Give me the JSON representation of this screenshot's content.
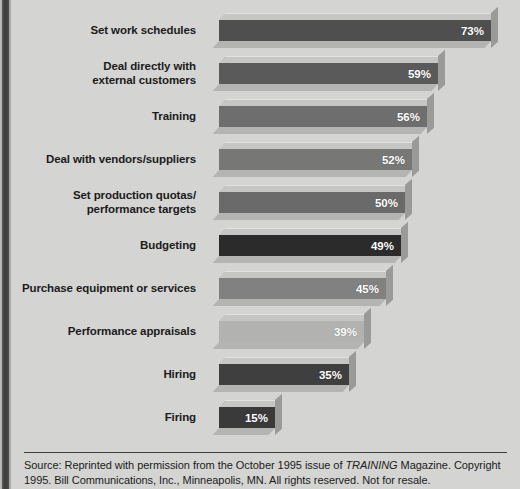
{
  "chart_data": {
    "type": "bar",
    "orientation": "horizontal",
    "title": "",
    "xlabel": "",
    "ylabel": "",
    "xlim": [
      0,
      80
    ],
    "grid": false,
    "legend": null,
    "value_suffix": "%",
    "categories": [
      "Set work schedules",
      "Deal directly with external customers",
      "Training",
      "Deal with vendors/suppliers",
      "Set production quotas/ performance targets",
      "Budgeting",
      "Purchase equipment or services",
      "Performance appraisals",
      "Hiring",
      "Firing"
    ],
    "values": [
      73,
      59,
      56,
      52,
      50,
      49,
      45,
      39,
      35,
      15
    ],
    "value_labels": [
      "73%",
      "59%",
      "56%",
      "52%",
      "50%",
      "49%",
      "45%",
      "39%",
      "35%",
      "15%"
    ],
    "bar_colors": [
      "#4f4f4f",
      "#5a5a5a",
      "#6e6e6e",
      "#777775",
      "#6a6a6a",
      "#2b2b2b",
      "#818181",
      "#b2b2b0",
      "#3f3f3f",
      "#3a3a3a"
    ]
  },
  "rows": [
    {
      "label_lines": [
        "Set work schedules"
      ],
      "value": "73%"
    },
    {
      "label_lines": [
        "Deal directly with",
        "external customers"
      ],
      "value": "59%"
    },
    {
      "label_lines": [
        "Training"
      ],
      "value": "56%"
    },
    {
      "label_lines": [
        "Deal with vendors/suppliers"
      ],
      "value": "52%"
    },
    {
      "label_lines": [
        "Set production quotas/",
        "performance targets"
      ],
      "value": "50%"
    },
    {
      "label_lines": [
        "Budgeting"
      ],
      "value": "49%"
    },
    {
      "label_lines": [
        "Purchase equipment or services"
      ],
      "value": "45%"
    },
    {
      "label_lines": [
        "Performance appraisals"
      ],
      "value": "39%"
    },
    {
      "label_lines": [
        "Hiring"
      ],
      "value": "35%"
    },
    {
      "label_lines": [
        "Firing"
      ],
      "value": "15%"
    }
  ],
  "footer": {
    "source_prefix": "Source: Reprinted with permission from the October 1995 issue of ",
    "source_italic": "TRAINING",
    "source_suffix": " Magazine. Copyright 1995. Bill Communications, Inc., Minneapolis, MN. All rights reserved. Not for resale."
  },
  "colors": {
    "paper": "#d4d4d2",
    "text": "#1b1b1b",
    "value_text": "#ffffff",
    "rule": "#3b3b3b",
    "bar_top_bevel": "#c6c6c4",
    "bar_side": "#9a9a98"
  }
}
